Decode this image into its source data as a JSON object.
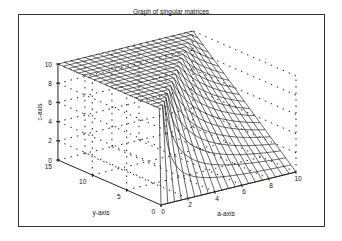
{
  "chart_data": {
    "type": "surface",
    "title": "Graph of singular matrices",
    "xlabel": "a-axis",
    "ylabel": "y-axis",
    "zlabel": "c-axis",
    "x_ticks": [
      0,
      2,
      4,
      6,
      8,
      10
    ],
    "y_ticks": [
      0,
      5,
      10,
      15
    ],
    "z_ticks": [
      0,
      2,
      4,
      6,
      8,
      10
    ],
    "xlim": [
      0,
      10
    ],
    "ylim": [
      0,
      15
    ],
    "zlim": [
      0,
      10
    ],
    "grid": true,
    "surface": {
      "description": "c = (2/3) * y / a * 10 / 10, clipped at c = 10 (singular 2x2 matrix surface)",
      "formula_coefficient": 6.667,
      "a_steps": 20,
      "y_steps": 20
    }
  },
  "projection": {
    "origin": [
      161,
      205
    ],
    "a_unit": [
      13.5,
      -3.3
    ],
    "y_unit": [
      -6.87,
      -3.0
    ],
    "c_unit": [
      0,
      -9.6
    ]
  }
}
